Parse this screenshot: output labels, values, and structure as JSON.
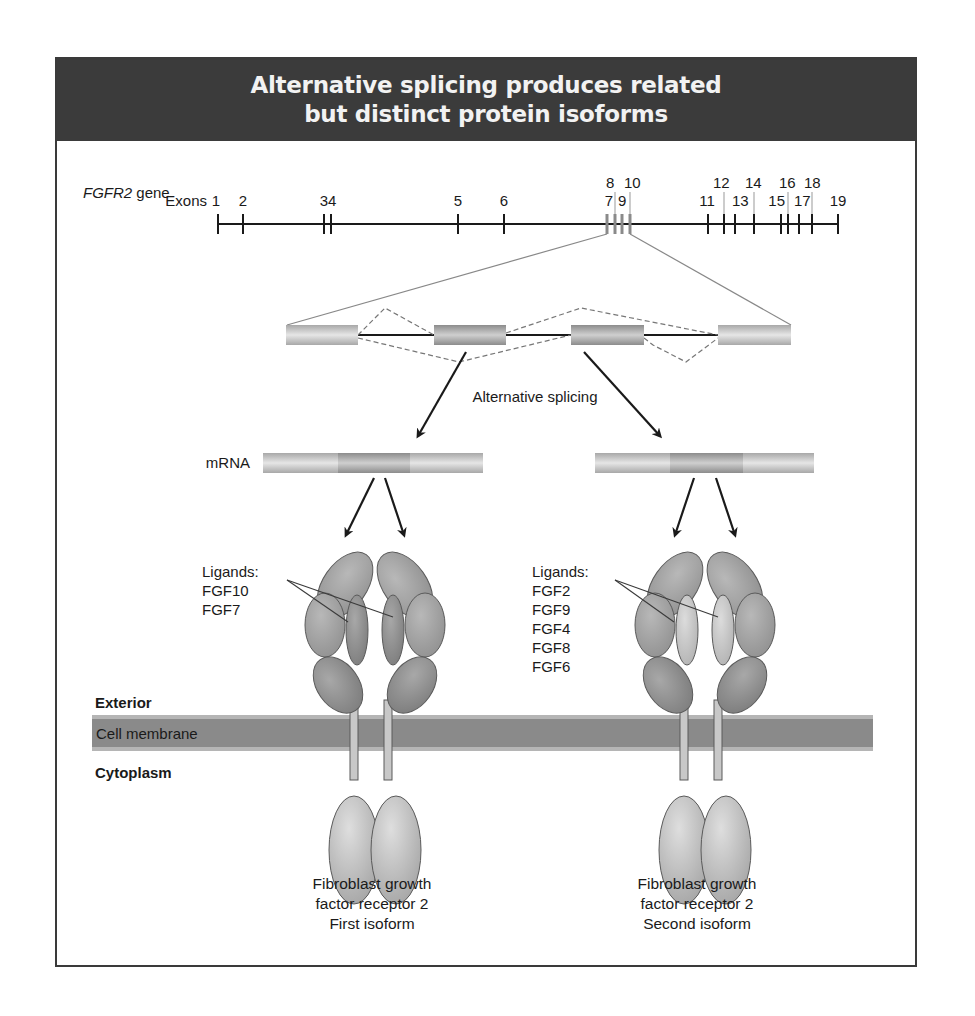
{
  "title": {
    "line1": "Alternative splicing produces related",
    "line2": "but distinct protein isoforms"
  },
  "gene": {
    "name": "FGFR2",
    "suffix": " gene",
    "exons_label": "Exons",
    "exons": [
      {
        "n": "1",
        "x": 218,
        "row": "low",
        "style": "major"
      },
      {
        "n": "2",
        "x": 243,
        "row": "low",
        "style": "major"
      },
      {
        "n": "3",
        "x": 324,
        "row": "low",
        "style": "major"
      },
      {
        "n": "4",
        "x": 331,
        "row": "low",
        "style": "major"
      },
      {
        "n": "5",
        "x": 458,
        "row": "low",
        "style": "major"
      },
      {
        "n": "6",
        "x": 504,
        "row": "low",
        "style": "major"
      },
      {
        "n": "7",
        "x": 607,
        "row": "low",
        "style": "alt"
      },
      {
        "n": "8",
        "x": 615,
        "row": "high",
        "style": "alt"
      },
      {
        "n": "9",
        "x": 622,
        "row": "low",
        "style": "alt"
      },
      {
        "n": "10",
        "x": 630,
        "row": "high",
        "style": "alt"
      },
      {
        "n": "11",
        "x": 708,
        "row": "low",
        "style": "major"
      },
      {
        "n": "12",
        "x": 724,
        "row": "high",
        "style": "major"
      },
      {
        "n": "13",
        "x": 735,
        "row": "low",
        "style": "major"
      },
      {
        "n": "14",
        "x": 754,
        "row": "high",
        "style": "major"
      },
      {
        "n": "15",
        "x": 781,
        "row": "low",
        "style": "major"
      },
      {
        "n": "16",
        "x": 788,
        "row": "high",
        "style": "major"
      },
      {
        "n": "17",
        "x": 799,
        "row": "low",
        "style": "major"
      },
      {
        "n": "18",
        "x": 812,
        "row": "high",
        "style": "major"
      },
      {
        "n": "19",
        "x": 838,
        "row": "low",
        "style": "major"
      }
    ]
  },
  "splicing": {
    "label": "Alternative splicing",
    "mrna_label": "mRNA"
  },
  "isoforms": [
    {
      "ligands_label": "Ligands:",
      "ligands": [
        "FGF10",
        "FGF7"
      ],
      "caption": [
        "Fibroblast growth",
        "factor receptor 2",
        "First isoform"
      ]
    },
    {
      "ligands_label": "Ligands:",
      "ligands": [
        "FGF2",
        "FGF9",
        "FGF4",
        "FGF8",
        "FGF6"
      ],
      "caption": [
        "Fibroblast growth",
        "factor receptor 2",
        "Second isoform"
      ]
    }
  ],
  "membrane": {
    "exterior": "Exterior",
    "membrane": "Cell membrane",
    "cytoplasm": "Cytoplasm"
  },
  "colors": {
    "header_bg": "#3b3b3b",
    "membrane": "#8a8a8a",
    "domain_dark": "#8c8c8c",
    "domain_mid": "#a3a3a3",
    "domain_light": "#c4c4c4"
  }
}
